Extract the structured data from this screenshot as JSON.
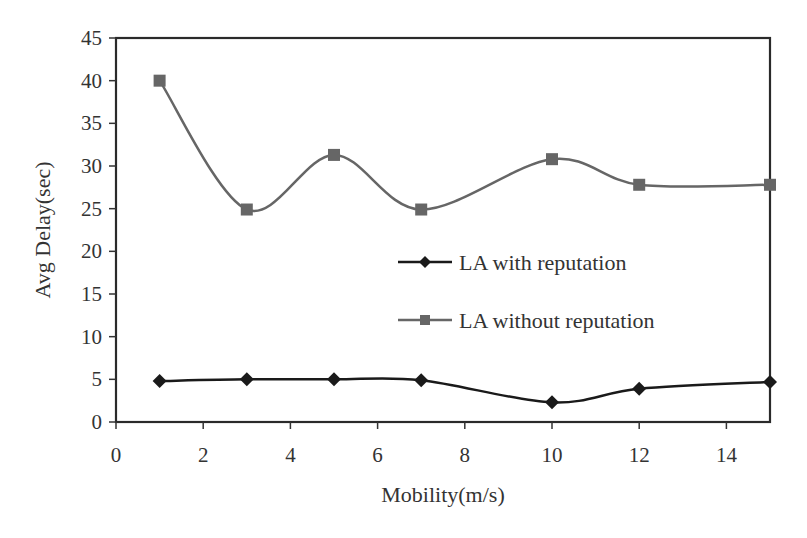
{
  "chart_data": {
    "type": "line",
    "title": "",
    "xlabel": "Mobility(m/s)",
    "ylabel": "Avg Delay(sec)",
    "xlim": [
      0,
      15
    ],
    "ylim": [
      0,
      45
    ],
    "xticks": [
      0,
      2,
      4,
      6,
      8,
      10,
      12,
      14
    ],
    "yticks": [
      0,
      5,
      10,
      15,
      20,
      25,
      30,
      35,
      40,
      45
    ],
    "grid": false,
    "legend_position": "center-right inside plot",
    "x": [
      1,
      3,
      5,
      7,
      10,
      12,
      15
    ],
    "series": [
      {
        "name": "LA with reputation",
        "marker": "diamond",
        "color": "#1a1a1a",
        "smooth": true,
        "values": [
          4.8,
          5.0,
          5.0,
          4.9,
          2.3,
          3.9,
          4.7
        ]
      },
      {
        "name": "LA without reputation",
        "marker": "square",
        "color": "#666666",
        "smooth": true,
        "values": [
          40.0,
          24.9,
          31.3,
          24.9,
          30.8,
          27.8,
          27.8
        ]
      }
    ]
  }
}
